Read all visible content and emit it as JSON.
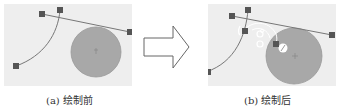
{
  "figure": {
    "panels": [
      {
        "id": "a",
        "caption": "(a) 绘制前"
      },
      {
        "id": "b",
        "caption": "(b) 绘制后"
      }
    ],
    "colors": {
      "panel_bg": "#eeeeee",
      "circle_fill": "#a8a8a8",
      "circle_stroke": "#999999",
      "line": "#777777",
      "handle": "#555555",
      "arrow_stroke": "#666666"
    }
  }
}
